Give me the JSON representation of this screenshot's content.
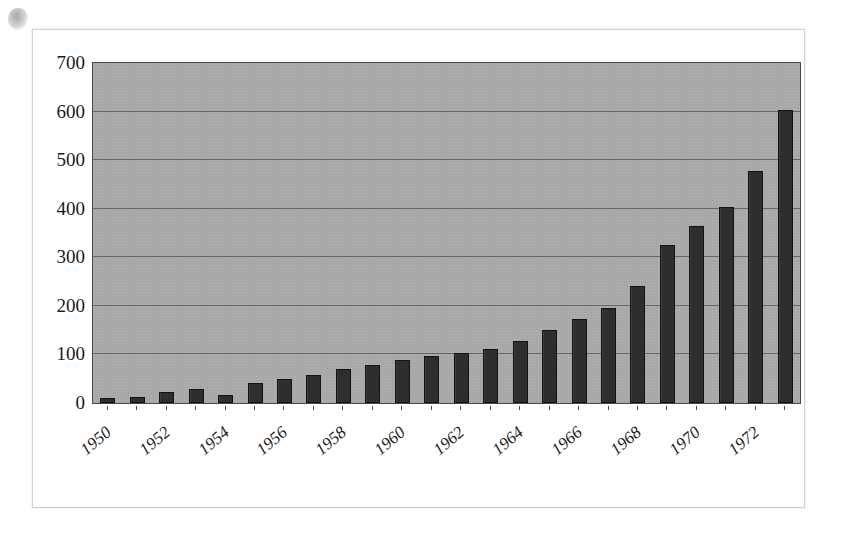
{
  "figure": {
    "artifact_name": "scan-smudge"
  },
  "chart_data": {
    "type": "bar",
    "title": "",
    "subtitle": "",
    "xlabel": "",
    "ylabel": "",
    "ylim": [
      0,
      700
    ],
    "ytick_values": [
      0,
      100,
      200,
      300,
      400,
      500,
      600,
      700
    ],
    "ytick_labels": [
      "0",
      "100",
      "200",
      "300",
      "400",
      "500",
      "600",
      "700"
    ],
    "grid": true,
    "grid_axis": "y",
    "legend": false,
    "legend_position": "none",
    "bar_color": "#2e2e2e",
    "plot_background_color": "#a8a8a8",
    "figure_background_color": "#ffffff",
    "xtick_labels_shown": [
      "1950",
      "1952",
      "1954",
      "1956",
      "1958",
      "1960",
      "1962",
      "1964",
      "1966",
      "1968",
      "1970",
      "1972"
    ],
    "xtick_label_rotation": -40,
    "categories": [
      "1950",
      "1951",
      "1952",
      "1953",
      "1954",
      "1955",
      "1956",
      "1957",
      "1958",
      "1959",
      "1960",
      "1961",
      "1962",
      "1963",
      "1964",
      "1965",
      "1966",
      "1967",
      "1968",
      "1969",
      "1970",
      "1971",
      "1972",
      "1973"
    ],
    "values": [
      10,
      12,
      22,
      29,
      17,
      42,
      50,
      58,
      70,
      78,
      89,
      96,
      103,
      112,
      127,
      151,
      172,
      196,
      240,
      325,
      364,
      404,
      477,
      603
    ]
  }
}
